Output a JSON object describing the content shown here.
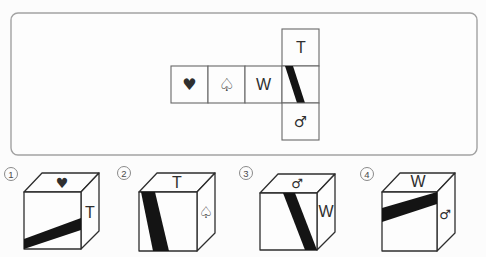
{
  "colors": {
    "stripe": "#141414",
    "outline": "#2e2e2e",
    "box_border": "#a2a2a2"
  },
  "net": {
    "row_faces": [
      {
        "symbol": "♥",
        "name": "heart"
      },
      {
        "symbol": "♤",
        "name": "spade-outline"
      },
      {
        "symbol": "W",
        "name": "letter-w"
      },
      {
        "symbol": "",
        "name": "diagonal-stripe"
      }
    ],
    "top_face": {
      "symbol": "T",
      "name": "letter-t"
    },
    "bottom_face": {
      "symbol": "♂",
      "name": "mars"
    },
    "stripe": {
      "description": "thick black diagonal band, top-left to bottom-centre",
      "points": "285,66 293,66 305,103 297,103"
    }
  },
  "options": [
    {
      "number": "1",
      "top_face": "♥",
      "side_face": "T",
      "stripe": {
        "description": "band rising from bottom-left corner to mid-right edge of front face",
        "points": "24,239 81,218 81,230 24,249"
      }
    },
    {
      "number": "2",
      "top_face": "T",
      "side_face": "♤",
      "stripe": {
        "description": "steep band from top-left edge down to bottom-centre of front face",
        "points": "141,192 155,192 169,251 153,251"
      }
    },
    {
      "number": "3",
      "top_face": "♂",
      "side_face": "W",
      "stripe": {
        "description": "steep band from top-centre down to bottom-right corner of front face",
        "points": "283,193 295,193 317,250 305,250"
      }
    },
    {
      "number": "4",
      "top_face": "W",
      "side_face": "♂",
      "stripe": {
        "description": "band rising from mid-left edge to top-right corner of front face",
        "points": "382,208 437,192 437,204 382,222"
      }
    }
  ]
}
